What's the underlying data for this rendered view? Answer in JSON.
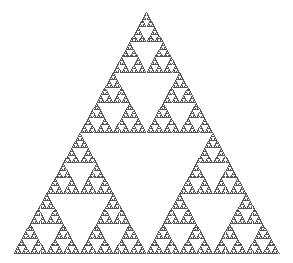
{
  "figure": {
    "rows": 256,
    "apex": [
      146,
      12
    ],
    "base_left": [
      14,
      253
    ],
    "base_right": [
      279,
      253
    ],
    "dot_color": "#555555",
    "background": "#ffffff"
  }
}
